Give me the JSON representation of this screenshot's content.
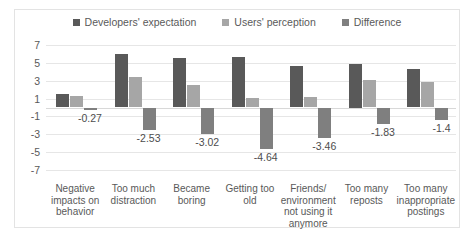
{
  "chart_data": {
    "type": "bar",
    "title": "",
    "subtitle": "",
    "xlabel": "",
    "ylabel": "",
    "ylim": [
      -7,
      7
    ],
    "yticks": [
      7,
      5,
      3,
      1,
      -1,
      -3,
      -5,
      -7
    ],
    "grid": true,
    "legend_position": "top-center",
    "categories": [
      "Negative impacts on behavior",
      "Too much distraction",
      "Became boring",
      "Getting too old",
      "Friends/ environment not using it anymore",
      "Too many reposts",
      "Too many inappropriate postings"
    ],
    "series": [
      {
        "name": "Developers' expectation",
        "color": "#595959",
        "values": [
          1.5,
          6.0,
          5.5,
          5.7,
          4.6,
          4.9,
          4.3
        ]
      },
      {
        "name": "Users' perception",
        "color": "#a6a6a6",
        "values": [
          1.3,
          3.4,
          2.5,
          1.1,
          1.2,
          3.1,
          2.9
        ]
      },
      {
        "name": "Difference",
        "color": "#7f7f7f",
        "values": [
          -0.27,
          -2.53,
          -3.02,
          -4.64,
          -3.46,
          -1.83,
          -1.4
        ]
      }
    ],
    "data_labels": [
      "-0.27",
      "-2.53",
      "-3.02",
      "-4.64",
      "-3.46",
      "-1.83",
      "-1.4"
    ]
  }
}
